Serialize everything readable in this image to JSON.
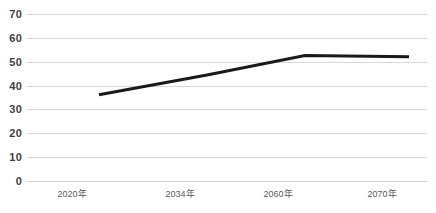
{
  "chart_data": {
    "type": "line",
    "title": "",
    "subtitle": "",
    "xlabel": "",
    "ylabel": "",
    "categories": [
      "2020年",
      "2034年",
      "2060年",
      "2070年"
    ],
    "series": [
      {
        "name": "",
        "values": [
          42,
          50.3,
          58.5,
          58
        ],
        "color": "#1a1a1a",
        "line_width": 3,
        "markers": false
      }
    ],
    "ylim": [
      0,
      70
    ],
    "yticks": [
      0,
      10,
      20,
      30,
      40,
      50,
      60,
      70
    ],
    "ytick_labels": [
      "0",
      "10",
      "20",
      "30",
      "40",
      "50",
      "60",
      "70"
    ],
    "xtick_labels": [
      "2020年",
      "2034年",
      "2060年",
      "2070年"
    ],
    "grid": true,
    "grid_axis": "y",
    "grid_color": "#d9d9d9",
    "legend": false,
    "legend_position": "none",
    "background_color": "#ffffff",
    "annotations": []
  }
}
